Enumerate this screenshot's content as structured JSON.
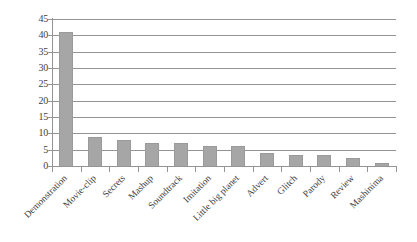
{
  "chart_data": {
    "type": "bar",
    "title": "",
    "subtitle": "",
    "xlabel": "",
    "ylabel": "",
    "categories": [
      "Demonstration",
      "Movie-clip",
      "Secrets",
      "Mashup",
      "Soundtrack",
      "Imitation",
      "Little big planet",
      "Advert",
      "Glitch",
      "Parody",
      "Review",
      "Mashinima"
    ],
    "values": [
      41,
      9,
      8,
      7,
      7,
      6,
      6,
      4,
      3.5,
      3.5,
      2.5,
      1
    ],
    "ylim": [
      0,
      45
    ],
    "ytick_values": [
      0,
      5,
      10,
      15,
      20,
      25,
      30,
      35,
      40,
      45
    ],
    "ytick_labels": [
      "0",
      "5",
      "10",
      "15",
      "20",
      "25",
      "30",
      "35",
      "40",
      "45"
    ],
    "grid": true,
    "grid_axis": "y",
    "legend": false,
    "legend_position": "none",
    "series": [
      {
        "name": "",
        "values": [
          41,
          9,
          8,
          7,
          7,
          6,
          6,
          4,
          3.5,
          3.5,
          2.5,
          1
        ]
      }
    ],
    "bar_color": "#a6a6a6",
    "bar_edge_color": "#9a9a9a",
    "axis_color": "#949494",
    "background_color": "#ffffff",
    "xtick_label_rotation": -45
  }
}
